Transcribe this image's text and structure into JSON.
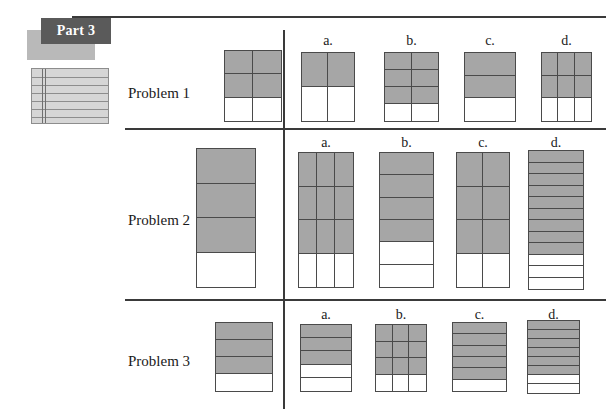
{
  "header": {
    "part_label": "Part 3",
    "notebook_icon": "notebook-paper-icon"
  },
  "option_letters": [
    "a.",
    "b.",
    "c.",
    "d."
  ],
  "problems": [
    {
      "label": "Problem 1",
      "reference": {
        "name": "problem-1-reference-figure",
        "cols": 2,
        "rows": 3,
        "shaded_rows": 2,
        "fraction": "4/6"
      },
      "options": [
        {
          "letter": "a.",
          "name": "problem-1-option-a-figure",
          "cols": 2,
          "rows": 2,
          "shaded_rows": 1,
          "fraction": "2/4"
        },
        {
          "letter": "b.",
          "name": "problem-1-option-b-figure",
          "cols": 2,
          "rows": 4,
          "shaded_rows": 3,
          "fraction": "6/8"
        },
        {
          "letter": "c.",
          "name": "problem-1-option-c-figure",
          "cols": 1,
          "rows": 3,
          "shaded_rows": 2,
          "fraction": "2/3"
        },
        {
          "letter": "d.",
          "name": "problem-1-option-d-figure",
          "cols": 3,
          "rows": 3,
          "shaded_rows": 2,
          "fraction": "6/9"
        }
      ]
    },
    {
      "label": "Problem 2",
      "reference": {
        "name": "problem-2-reference-figure",
        "cols": 1,
        "rows": 4,
        "shaded_rows": 3,
        "fraction": "3/4"
      },
      "options": [
        {
          "letter": "a.",
          "name": "problem-2-option-a-figure",
          "cols": 3,
          "rows": 4,
          "shaded_rows": 3,
          "fraction": "9/12"
        },
        {
          "letter": "b.",
          "name": "problem-2-option-b-figure",
          "cols": 1,
          "rows": 6,
          "shaded_rows": 4,
          "fraction": "4/6"
        },
        {
          "letter": "c.",
          "name": "problem-2-option-c-figure",
          "cols": 2,
          "rows": 4,
          "shaded_rows": 3,
          "fraction": "6/8"
        },
        {
          "letter": "d.",
          "name": "problem-2-option-d-figure",
          "cols": 1,
          "rows": 12,
          "shaded_rows": 9,
          "fraction": "9/12"
        }
      ]
    },
    {
      "label": "Problem 3",
      "reference": {
        "name": "problem-3-reference-figure",
        "cols": 1,
        "rows": 4,
        "shaded_rows": 3,
        "fraction": "3/4"
      },
      "options": [
        {
          "letter": "a.",
          "name": "problem-3-option-a-figure",
          "cols": 1,
          "rows": 5,
          "shaded_rows": 3,
          "fraction": "3/5"
        },
        {
          "letter": "b.",
          "name": "problem-3-option-b-figure",
          "cols": 3,
          "rows": 4,
          "shaded_rows": 3,
          "fraction": "9/12"
        },
        {
          "letter": "c.",
          "name": "problem-3-option-c-figure",
          "cols": 1,
          "rows": 6,
          "shaded_rows": 5,
          "fraction": "5/6"
        },
        {
          "letter": "d.",
          "name": "problem-3-option-d-figure",
          "cols": 1,
          "rows": 8,
          "shaded_rows": 6,
          "fraction": "6/8"
        }
      ]
    }
  ],
  "colors": {
    "shade": "#a6a6a6",
    "rule": "#3a3a3a",
    "badge_bg": "#5a5a5a",
    "badge_shadow": "#b9b9b9",
    "notebook_bg": "#d6d6d6"
  },
  "geometry": {
    "label_positions": [
      {
        "left": 128,
        "top": 85
      },
      {
        "left": 128,
        "top": 212
      },
      {
        "left": 128,
        "top": 353
      }
    ],
    "rows": [
      {
        "reference": {
          "left": 224,
          "top": 50,
          "width": 58,
          "height": 72
        },
        "letters_top": 33,
        "options": [
          {
            "left": 301,
            "top": 52,
            "width": 54,
            "height": 70
          },
          {
            "left": 384,
            "top": 52,
            "width": 55,
            "height": 70
          },
          {
            "left": 464,
            "top": 52,
            "width": 52,
            "height": 70
          },
          {
            "left": 541,
            "top": 52,
            "width": 51,
            "height": 70
          }
        ]
      },
      {
        "reference": {
          "left": 196,
          "top": 148,
          "width": 60,
          "height": 140
        },
        "letters_top": 135,
        "options": [
          {
            "left": 298,
            "top": 152,
            "width": 56,
            "height": 136
          },
          {
            "left": 379,
            "top": 152,
            "width": 55,
            "height": 136
          },
          {
            "left": 456,
            "top": 152,
            "width": 54,
            "height": 136
          },
          {
            "left": 528,
            "top": 150,
            "width": 56,
            "height": 140
          }
        ]
      },
      {
        "reference": {
          "left": 215,
          "top": 322,
          "width": 58,
          "height": 70
        },
        "letters_top": 307,
        "options": [
          {
            "left": 300,
            "top": 324,
            "width": 52,
            "height": 68
          },
          {
            "left": 375,
            "top": 324,
            "width": 52,
            "height": 68
          },
          {
            "left": 452,
            "top": 322,
            "width": 55,
            "height": 70
          },
          {
            "left": 527,
            "top": 320,
            "width": 53,
            "height": 74
          }
        ]
      }
    ]
  }
}
